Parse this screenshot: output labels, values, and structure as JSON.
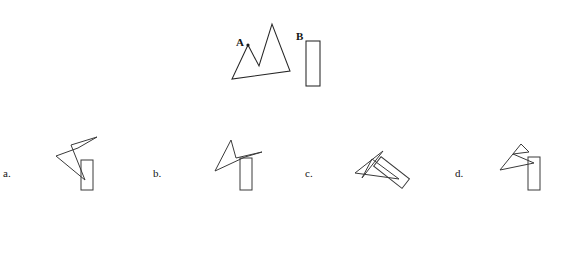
{
  "task": {
    "type": "mental-rotation-multiple-choice",
    "background_color": "#ffffff",
    "stroke_color": "#3a3a3a",
    "target_stroke_color": "#262626",
    "text_color": "#141414"
  },
  "prompt": {
    "shape_a_label": "A",
    "shape_b_label": "B",
    "shape_a_name": "zigzag-mountain-polygon",
    "shape_b_name": "tall-narrow-rectangle"
  },
  "target": {
    "shape_a": {
      "label": "A",
      "label_pos": {
        "x": 236,
        "y": 46
      },
      "vertex_dot": {
        "x": 248,
        "y": 45
      },
      "points": "248,45 232,79 290,71 272,24 259,66",
      "closed": true
    },
    "shape_b": {
      "label": "B",
      "label_pos": {
        "x": 296,
        "y": 40
      },
      "rect": {
        "x": 306,
        "y": 41,
        "width": 14,
        "height": 45
      },
      "rotation": 0
    }
  },
  "options": [
    {
      "id": "a",
      "label": "a.",
      "label_pos": {
        "x": 3,
        "y": 168
      },
      "polygon_points": "78,148 56,156 85,180 71,145 97,137",
      "rect": {
        "x": 81,
        "y": 160,
        "width": 12,
        "height": 30,
        "rotation": 0,
        "cx": 87,
        "cy": 175
      }
    },
    {
      "id": "b",
      "label": "b.",
      "label_pos": {
        "x": 153,
        "y": 168
      },
      "polygon_points": "231,140 215,171 245,157 262,152 236,158",
      "rect": {
        "x": 240,
        "y": 158,
        "width": 12,
        "height": 32,
        "rotation": 0,
        "cx": 246,
        "cy": 174
      }
    },
    {
      "id": "c",
      "label": "c.",
      "label_pos": {
        "x": 305,
        "y": 168
      },
      "polygon_points": "383,151 355,173 399,179 372,159 362,178",
      "rect": {
        "x": 377,
        "y": 147,
        "width": 12,
        "height": 36,
        "rotation": -52,
        "cx": 395,
        "cy": 160
      }
    },
    {
      "id": "d",
      "label": "d.",
      "label_pos": {
        "x": 455,
        "y": 168
      },
      "polygon_points": "521,144 500,170 534,163 513,154 529,152",
      "rect": {
        "x": 528,
        "y": 157,
        "width": 12,
        "height": 33,
        "rotation": 0,
        "cx": 534,
        "cy": 173
      }
    }
  ]
}
